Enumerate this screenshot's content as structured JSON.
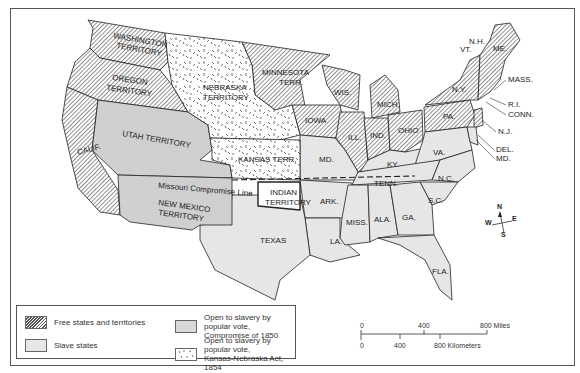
{
  "map": {
    "title": "United States after the Kansas-Nebraska Act, 1854",
    "regions": {
      "washington": "WASHINGTON",
      "washington2": "TERRITORY",
      "oregon": "OREGON",
      "oregon2": "TERRITORY",
      "nebraska": "NEBRASKA",
      "nebraska2": "TERRITORY",
      "minnesota": "MINNESOTA",
      "minnesota2": "TERR.",
      "utah": "UTAH TERRITORY",
      "calif": "CALIF.",
      "kansas": "KANSAS TERR.",
      "newmexico": "NEW MEXICO",
      "newmexico2": "TERRITORY",
      "indian": "INDIAN",
      "indian2": "TERRITORY",
      "texas": "TEXAS",
      "iowa": "IOWA",
      "wis": "WIS.",
      "mich": "MICH.",
      "ill": "ILL.",
      "ind": "IND.",
      "ohio": "OHIO",
      "pa": "PA.",
      "ny": "N.Y.",
      "vt": "VT.",
      "nh": "N.H.",
      "me": "ME.",
      "mass": "MASS.",
      "ri": "R.I.",
      "conn": "CONN.",
      "nj": "N.J.",
      "del": "DEL.",
      "md": "MD.",
      "mo": "MD.",
      "ky": "KY.",
      "va": "VA.",
      "tenn": "TENN.",
      "nc": "N.C.",
      "sc": "S.C.",
      "ark": "ARK.",
      "miss": "MISS.",
      "ala": "ALA.",
      "ga": "GA.",
      "la": "LA.",
      "fla": "FLA."
    },
    "annotations": {
      "missouri_line": "Missouri Compromise Line"
    },
    "compass": {
      "n": "N",
      "s": "S",
      "e": "E",
      "w": "W"
    },
    "colors": {
      "free_hatch": "#555555",
      "slave_fill": "#e6e6e6",
      "compromise_1850_fill": "#d8d8d8",
      "kansas_nebraska_fill": "#ffffff",
      "border": "#222222"
    }
  },
  "legend": {
    "items": [
      {
        "label": "Free states and territories"
      },
      {
        "label": "Slave states"
      },
      {
        "label": "Open to slavery by popular vote,",
        "label2": "Compromise of 1850"
      },
      {
        "label": "Open to slavery by popular vote,",
        "label2": "Kansas-Nebraska Act, 1854"
      }
    ]
  },
  "scale": {
    "miles": [
      "0",
      "400",
      "800 Miles"
    ],
    "km": [
      "0",
      "400",
      "800 Kilometers"
    ]
  }
}
